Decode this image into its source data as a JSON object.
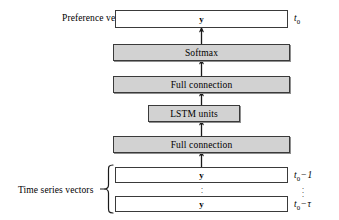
{
  "figure": {
    "background_color": "#ffffff",
    "box_fill_gray": "#d2d2d2",
    "box_fill_white": "#ffffff",
    "box_border_color": "#3a3a3a"
  },
  "labels": {
    "preference_vector": "Preference vector",
    "time_series_vectors": "Time series vectors"
  },
  "vector_glyph": "y",
  "layers": [
    {
      "id": "preference-vector",
      "label": "y",
      "style": "white",
      "time_label": "t0"
    },
    {
      "id": "softmax",
      "label": "Softmax",
      "style": "gray"
    },
    {
      "id": "full-connection-upper",
      "label": "Full connection",
      "style": "gray"
    },
    {
      "id": "lstm-units",
      "label": "LSTM units",
      "style": "gray"
    },
    {
      "id": "full-connection-lower",
      "label": "Full connection",
      "style": "gray"
    }
  ],
  "inputs": [
    {
      "id": "input-vector-first",
      "label": "y",
      "time_base": "t",
      "time_sub": "0",
      "time_op": "−",
      "time_offset": "1"
    },
    {
      "id": "input-vector-last",
      "label": "y",
      "time_base": "t",
      "time_sub": "0",
      "time_op": "−",
      "time_offset": "τ"
    }
  ],
  "time_markers": {
    "output": {
      "base": "t",
      "sub": "0"
    },
    "first_input": "t0 − 1",
    "last_input": "t0 − τ"
  },
  "ellipsis": "⋮"
}
